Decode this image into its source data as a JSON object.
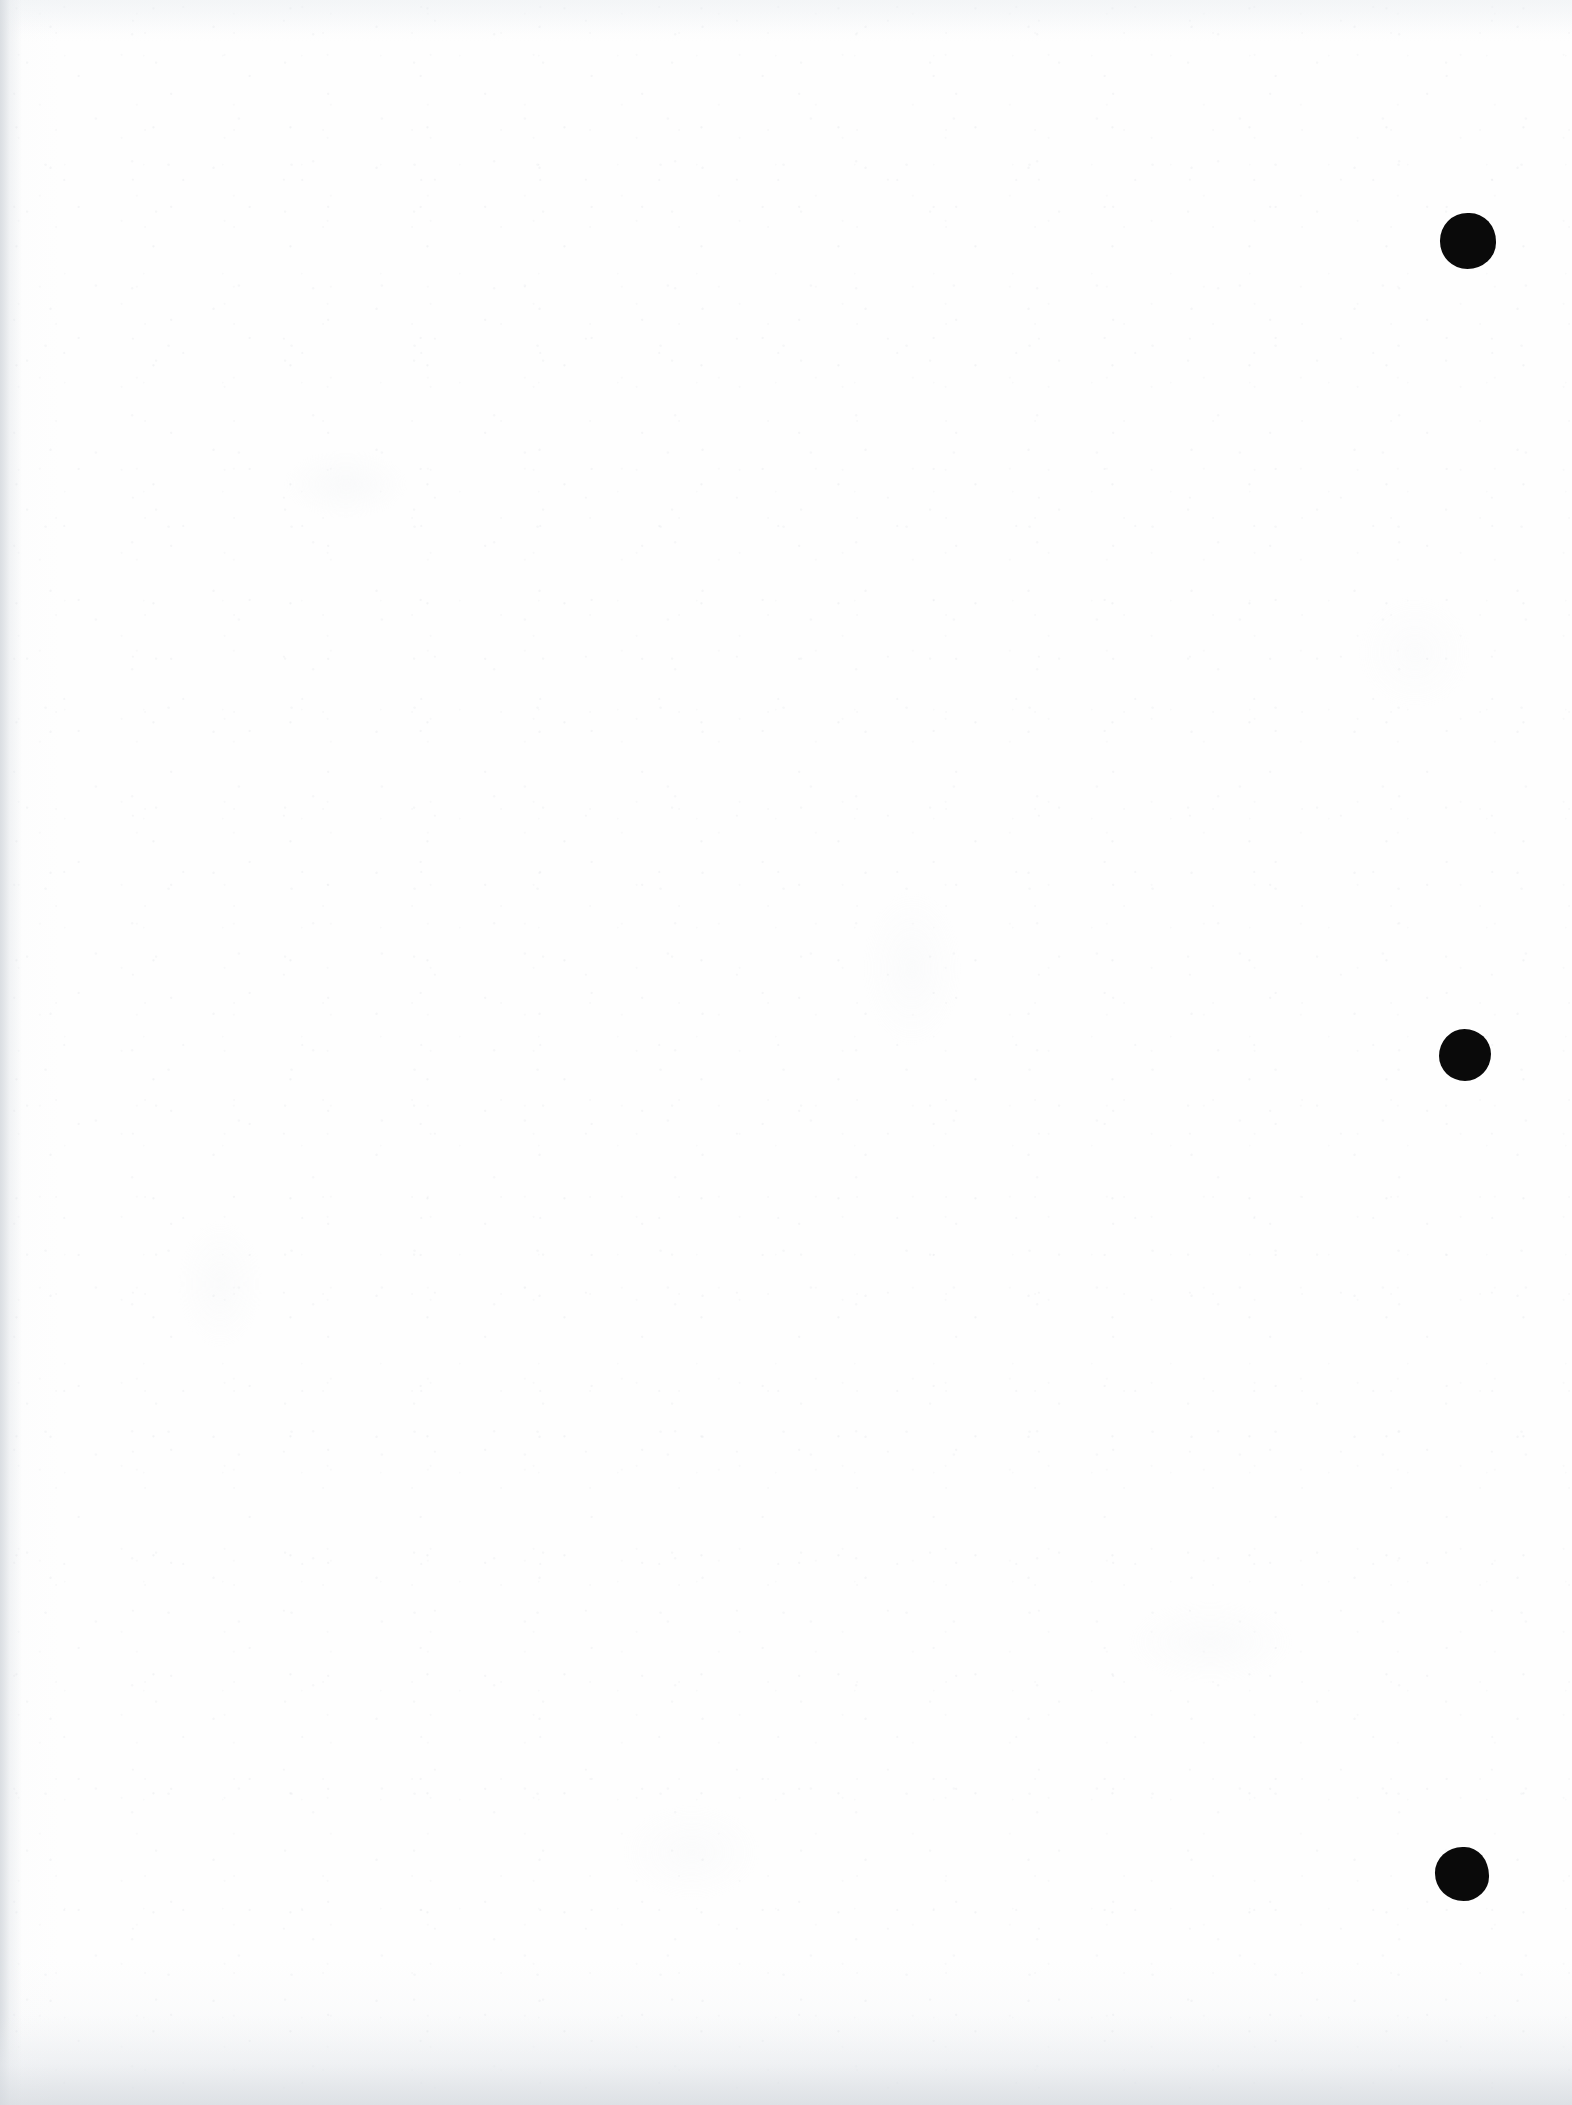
{
  "document": {
    "type": "scanned-page",
    "title": "Scanned blank document page",
    "page_width": 1572,
    "page_height": 2105,
    "orientation": "portrait",
    "background_color": "#fefefe",
    "text_content": "",
    "has_text": false,
    "has_figures": false,
    "notes": "Blank scanned sheet; only visible content is three round black ink marks in the right margin plus paper grain and scan edge shadows."
  },
  "marks": {
    "label": "binding-punch-marks",
    "color": "#0a0a0a",
    "count": 3,
    "items": [
      {
        "id": "dot-1",
        "name": "ink-dot-top",
        "cx": 1468,
        "cy": 241,
        "r": 28,
        "shape": "circle"
      },
      {
        "id": "dot-2",
        "name": "ink-dot-middle",
        "cx": 1465,
        "cy": 1055,
        "r": 26,
        "shape": "circle"
      },
      {
        "id": "dot-3",
        "name": "ink-dot-bottom",
        "cx": 1462,
        "cy": 1874,
        "r": 27,
        "shape": "irregular-circle"
      }
    ]
  },
  "artifacts": {
    "left_edge_shadow": {
      "present": true,
      "width": 22,
      "color": "#d4d8dd"
    },
    "bottom_edge_shadow": {
      "present": true,
      "height": 90,
      "color": "#d6dadf"
    },
    "top_edge_shadow": {
      "present": true,
      "height": 34,
      "color": "#eef1f4"
    },
    "paper_grain": {
      "present": true,
      "intensity": "very-low",
      "color": "#d2d6dc"
    }
  }
}
